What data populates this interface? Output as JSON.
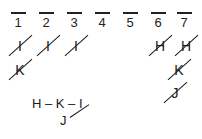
{
  "sheet": {
    "background_color": "#ffffff",
    "ink_color": "#1a1a1a",
    "columns": [
      {
        "label": "1"
      },
      {
        "label": "2"
      },
      {
        "label": "3"
      },
      {
        "label": "4"
      },
      {
        "label": "5"
      },
      {
        "label": "6"
      },
      {
        "label": "7"
      }
    ],
    "marks": [
      {
        "column": "1",
        "row": 1,
        "letter": "I",
        "crossed_out": true
      },
      {
        "column": "2",
        "row": 1,
        "letter": "I",
        "crossed_out": true
      },
      {
        "column": "3",
        "row": 1,
        "letter": "I",
        "crossed_out": true
      },
      {
        "column": "6",
        "row": 1,
        "letter": "H",
        "crossed_out": true
      },
      {
        "column": "7",
        "row": 1,
        "letter": "H",
        "crossed_out": true
      },
      {
        "column": "1",
        "row": 2,
        "letter": "K",
        "crossed_out": true
      },
      {
        "column": "7",
        "row": 2,
        "letter": "K",
        "crossed_out": true
      },
      {
        "column": "7",
        "row": 3,
        "letter": "J",
        "crossed_out": true
      }
    ],
    "note": {
      "chain": "H – K – I",
      "sub_letter": "J"
    }
  }
}
